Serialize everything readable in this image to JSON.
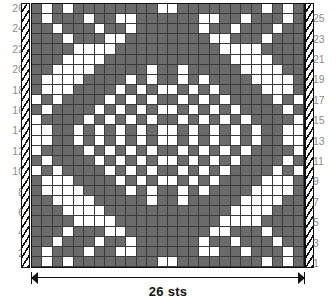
{
  "chart_title": "26 sts",
  "legend": {
    "dark_label": "main color stitch",
    "light_label": "contrast color stitch",
    "selvage_label": "selvage edge"
  },
  "colors": {
    "dark": "#6b6b6b",
    "light": "#ffffff",
    "grid_line": "#3a3a3a",
    "frame": "#111111",
    "label_text": "#8d8d8d"
  },
  "width_measure": {
    "label": "26 sts",
    "stitch_count": 26
  },
  "row_labels_left": [
    "26",
    "24",
    "22",
    "20",
    "18",
    "16",
    "14",
    "12",
    "10",
    "8",
    "6",
    "4",
    "2"
  ],
  "row_labels_right": [
    "25",
    "23",
    "21",
    "19",
    "17",
    "15",
    "13",
    "11",
    "9",
    "7",
    "5",
    "3",
    "1"
  ],
  "chart_data": {
    "type": "heatmap",
    "title": "26 sts",
    "xlabel": "26 sts",
    "ylabel": "",
    "rows": 26,
    "cols": 26,
    "value_legend": {
      "1": "dark / main color",
      "0": "white / contrast color"
    },
    "row_order": "top row is row 26, bottom row is row 1",
    "grid": [
      [
        1,
        0,
        1,
        0,
        1,
        1,
        1,
        1,
        1,
        1,
        1,
        1,
        0,
        0,
        1,
        1,
        1,
        1,
        1,
        1,
        1,
        1,
        0,
        1,
        0,
        1
      ],
      [
        1,
        0,
        1,
        1,
        1,
        0,
        1,
        1,
        0,
        0,
        1,
        1,
        1,
        1,
        1,
        1,
        0,
        0,
        1,
        1,
        0,
        1,
        1,
        1,
        0,
        1
      ],
      [
        1,
        1,
        0,
        1,
        1,
        1,
        0,
        1,
        1,
        0,
        1,
        1,
        1,
        1,
        1,
        1,
        0,
        1,
        1,
        0,
        1,
        1,
        1,
        0,
        1,
        1
      ],
      [
        1,
        1,
        1,
        0,
        1,
        1,
        1,
        0,
        0,
        1,
        1,
        1,
        1,
        1,
        1,
        1,
        1,
        0,
        0,
        1,
        1,
        1,
        0,
        1,
        1,
        1
      ],
      [
        1,
        1,
        1,
        1,
        0,
        0,
        0,
        0,
        1,
        1,
        1,
        1,
        1,
        1,
        1,
        1,
        1,
        1,
        0,
        0,
        0,
        0,
        1,
        1,
        1,
        1
      ],
      [
        1,
        1,
        1,
        0,
        0,
        0,
        0,
        1,
        1,
        1,
        1,
        1,
        1,
        1,
        1,
        1,
        1,
        1,
        1,
        0,
        0,
        0,
        0,
        1,
        1,
        1
      ],
      [
        1,
        1,
        0,
        0,
        0,
        0,
        1,
        1,
        1,
        1,
        1,
        0,
        1,
        1,
        0,
        1,
        1,
        1,
        1,
        1,
        0,
        0,
        0,
        0,
        1,
        1
      ],
      [
        1,
        0,
        0,
        0,
        0,
        1,
        1,
        1,
        1,
        0,
        1,
        0,
        1,
        1,
        0,
        1,
        0,
        1,
        1,
        1,
        1,
        0,
        0,
        0,
        0,
        1
      ],
      [
        1,
        0,
        0,
        0,
        1,
        1,
        1,
        1,
        0,
        1,
        0,
        1,
        0,
        0,
        1,
        0,
        1,
        0,
        1,
        1,
        1,
        1,
        0,
        0,
        0,
        1
      ],
      [
        0,
        1,
        0,
        1,
        1,
        1,
        1,
        0,
        1,
        0,
        1,
        0,
        1,
        1,
        0,
        1,
        0,
        1,
        0,
        1,
        1,
        1,
        1,
        0,
        1,
        0
      ],
      [
        1,
        0,
        1,
        1,
        1,
        1,
        0,
        1,
        0,
        1,
        0,
        1,
        0,
        0,
        1,
        0,
        1,
        0,
        1,
        0,
        1,
        1,
        1,
        1,
        0,
        1
      ],
      [
        0,
        1,
        1,
        1,
        1,
        0,
        1,
        0,
        1,
        0,
        1,
        0,
        1,
        1,
        0,
        1,
        0,
        1,
        0,
        1,
        0,
        1,
        1,
        1,
        1,
        0
      ],
      [
        0,
        0,
        1,
        1,
        0,
        1,
        0,
        1,
        0,
        1,
        0,
        1,
        0,
        0,
        1,
        0,
        1,
        0,
        1,
        0,
        1,
        0,
        1,
        1,
        0,
        0
      ],
      [
        0,
        0,
        1,
        1,
        0,
        1,
        0,
        1,
        0,
        1,
        0,
        1,
        0,
        0,
        1,
        0,
        1,
        0,
        1,
        0,
        1,
        0,
        1,
        1,
        0,
        0
      ],
      [
        0,
        1,
        1,
        1,
        1,
        0,
        1,
        0,
        1,
        0,
        1,
        0,
        1,
        1,
        0,
        1,
        0,
        1,
        0,
        1,
        0,
        1,
        1,
        1,
        1,
        0
      ],
      [
        1,
        0,
        1,
        1,
        1,
        1,
        0,
        1,
        0,
        1,
        0,
        1,
        0,
        0,
        1,
        0,
        1,
        0,
        1,
        0,
        1,
        1,
        1,
        1,
        0,
        1
      ],
      [
        0,
        1,
        0,
        1,
        1,
        1,
        1,
        0,
        1,
        0,
        1,
        0,
        1,
        1,
        0,
        1,
        0,
        1,
        0,
        1,
        1,
        1,
        1,
        0,
        1,
        0
      ],
      [
        1,
        0,
        0,
        0,
        1,
        1,
        1,
        1,
        0,
        1,
        0,
        1,
        0,
        0,
        1,
        0,
        1,
        0,
        1,
        1,
        1,
        1,
        0,
        0,
        0,
        1
      ],
      [
        1,
        0,
        0,
        0,
        0,
        1,
        1,
        1,
        1,
        0,
        1,
        0,
        1,
        1,
        0,
        1,
        0,
        1,
        1,
        1,
        1,
        0,
        0,
        0,
        0,
        1
      ],
      [
        1,
        1,
        0,
        0,
        0,
        0,
        1,
        1,
        1,
        1,
        1,
        0,
        1,
        1,
        0,
        1,
        1,
        1,
        1,
        1,
        0,
        0,
        0,
        0,
        1,
        1
      ],
      [
        1,
        1,
        1,
        0,
        0,
        0,
        0,
        1,
        1,
        1,
        1,
        1,
        1,
        1,
        1,
        1,
        1,
        1,
        1,
        0,
        0,
        0,
        0,
        1,
        1,
        1
      ],
      [
        1,
        1,
        1,
        1,
        0,
        0,
        0,
        0,
        1,
        1,
        1,
        1,
        1,
        1,
        1,
        1,
        1,
        1,
        0,
        0,
        0,
        0,
        1,
        1,
        1,
        1
      ],
      [
        1,
        1,
        1,
        0,
        1,
        1,
        1,
        0,
        0,
        1,
        1,
        1,
        1,
        1,
        1,
        1,
        1,
        0,
        0,
        1,
        1,
        1,
        0,
        1,
        1,
        1
      ],
      [
        1,
        1,
        0,
        1,
        1,
        1,
        0,
        1,
        1,
        0,
        1,
        1,
        1,
        1,
        1,
        1,
        0,
        1,
        1,
        0,
        1,
        1,
        1,
        0,
        1,
        1
      ],
      [
        1,
        0,
        1,
        1,
        1,
        0,
        1,
        1,
        0,
        0,
        1,
        1,
        1,
        1,
        1,
        1,
        0,
        0,
        1,
        1,
        0,
        1,
        1,
        1,
        0,
        1
      ],
      [
        1,
        0,
        1,
        0,
        1,
        1,
        1,
        1,
        1,
        1,
        1,
        1,
        0,
        0,
        1,
        1,
        1,
        1,
        1,
        1,
        1,
        1,
        0,
        1,
        0,
        1
      ]
    ]
  }
}
